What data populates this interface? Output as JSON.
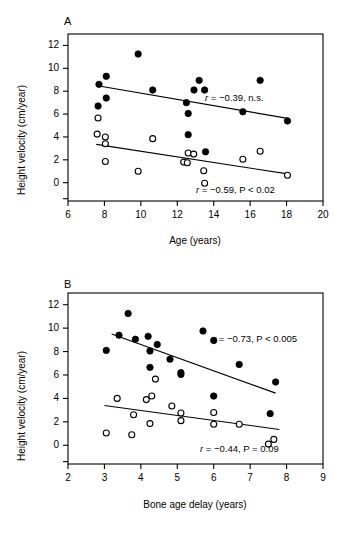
{
  "figure": {
    "panels": [
      {
        "letter": "A",
        "chart_data": {
          "type": "scatter",
          "title": "",
          "xlabel": "Age (years)",
          "ylabel": "Height velocity (cm/year)",
          "xlim": [
            6,
            20
          ],
          "ylim": [
            -1.6,
            13
          ],
          "xticks": [
            6,
            8,
            10,
            12,
            14,
            16,
            18,
            20
          ],
          "xtick_labels": [
            "6",
            "8",
            "10",
            "12",
            "14",
            "16",
            "18",
            "20"
          ],
          "yticks": [
            0,
            2,
            4,
            6,
            8,
            10,
            12
          ],
          "ytick_labels": [
            "0",
            "2",
            "4",
            "6",
            "8",
            "10",
            "12"
          ],
          "grid": false,
          "legend": "none",
          "series": [
            {
              "name": "filled-circles",
              "marker": "filled-circle",
              "points": [
                [
                  7.7,
                  8.6
                ],
                [
                  7.65,
                  6.7
                ],
                [
                  8.1,
                  9.3
                ],
                [
                  8.1,
                  7.4
                ],
                [
                  9.85,
                  11.25
                ],
                [
                  10.65,
                  8.1
                ],
                [
                  12.5,
                  7.0
                ],
                [
                  12.6,
                  6.05
                ],
                [
                  12.6,
                  4.2
                ],
                [
                  13.2,
                  8.95
                ],
                [
                  13.5,
                  8.1
                ],
                [
                  13.55,
                  2.7
                ],
                [
                  15.6,
                  6.2
                ],
                [
                  16.55,
                  8.95
                ],
                [
                  18.05,
                  5.4
                ]
              ],
              "trendline": {
                "x1": 7.55,
                "y1": 8.5,
                "x2": 18.15,
                "y2": 5.6
              },
              "annotation": "r = −0.39, n.s.",
              "annotation_r": "−0.39",
              "annotation_p": "n.s."
            },
            {
              "name": "open-circles",
              "marker": "open-circle",
              "points": [
                [
                  7.65,
                  5.65
                ],
                [
                  7.6,
                  4.25
                ],
                [
                  8.05,
                  4.0
                ],
                [
                  8.05,
                  3.4
                ],
                [
                  8.05,
                  1.85
                ],
                [
                  9.85,
                  1.0
                ],
                [
                  10.65,
                  3.85
                ],
                [
                  12.35,
                  1.8
                ],
                [
                  12.55,
                  1.75
                ],
                [
                  12.6,
                  2.6
                ],
                [
                  12.9,
                  2.5
                ],
                [
                  13.45,
                  1.05
                ],
                [
                  13.5,
                  -0.05
                ],
                [
                  15.6,
                  2.05
                ],
                [
                  16.55,
                  2.75
                ],
                [
                  18.05,
                  0.65
                ]
              ],
              "trendline": {
                "x1": 7.55,
                "y1": 3.35,
                "x2": 18.15,
                "y2": 0.75
              },
              "annotation": "r = −0.59, P < 0.02",
              "annotation_r": "−0.59",
              "annotation_p": "P < 0.02"
            }
          ]
        }
      },
      {
        "letter": "B",
        "chart_data": {
          "type": "scatter",
          "title": "",
          "xlabel": "Bone age delay (years)",
          "ylabel": "Height velocity (cm/year)",
          "xlim": [
            2,
            9
          ],
          "ylim": [
            -1.6,
            13
          ],
          "xticks": [
            2,
            3,
            4,
            5,
            6,
            7,
            8,
            9
          ],
          "xtick_labels": [
            "2",
            "3",
            "4",
            "5",
            "6",
            "7",
            "8",
            "9"
          ],
          "yticks": [
            0,
            2,
            4,
            6,
            8,
            10,
            12
          ],
          "ytick_labels": [
            "0",
            "2",
            "4",
            "6",
            "8",
            "10",
            "12"
          ],
          "grid": false,
          "legend": "none",
          "series": [
            {
              "name": "filled-circles",
              "marker": "filled-circle",
              "points": [
                [
                  3.05,
                  8.1
                ],
                [
                  3.4,
                  9.4
                ],
                [
                  3.65,
                  11.25
                ],
                [
                  3.85,
                  9.05
                ],
                [
                  4.2,
                  9.3
                ],
                [
                  4.25,
                  8.05
                ],
                [
                  4.25,
                  6.65
                ],
                [
                  4.45,
                  8.6
                ],
                [
                  4.8,
                  7.35
                ],
                [
                  5.1,
                  6.2
                ],
                [
                  5.1,
                  6.05
                ],
                [
                  6.0,
                  8.95
                ],
                [
                  6.0,
                  4.2
                ],
                [
                  6.7,
                  6.9
                ],
                [
                  7.55,
                  2.7
                ],
                [
                  7.7,
                  5.4
                ]
              ],
              "trendline": {
                "x1": 3.2,
                "y1": 9.5,
                "x2": 7.7,
                "y2": 4.45
              },
              "annotation": "r = −0.73, P < 0.005",
              "annotation_r": "−0.73",
              "annotation_p": "P < 0.005"
            },
            {
              "name": "open-circles",
              "marker": "open-circle",
              "points": [
                [
                  3.05,
                  1.05
                ],
                [
                  3.35,
                  4.0
                ],
                [
                  3.8,
                  2.6
                ],
                [
                  3.75,
                  0.9
                ],
                [
                  4.15,
                  3.9
                ],
                [
                  4.25,
                  1.85
                ],
                [
                  4.3,
                  4.2
                ],
                [
                  4.4,
                  5.65
                ],
                [
                  4.85,
                  3.35
                ],
                [
                  5.1,
                  2.75
                ],
                [
                  5.1,
                  2.1
                ],
                [
                  6.0,
                  2.8
                ],
                [
                  6.0,
                  1.8
                ],
                [
                  6.7,
                  1.8
                ],
                [
                  7.5,
                  0.1
                ],
                [
                  7.65,
                  0.5
                ]
              ],
              "trendline": {
                "x1": 3.0,
                "y1": 3.4,
                "x2": 7.8,
                "y2": 1.35
              },
              "annotation": "r = −0.44, P = 0.09",
              "annotation_r": "−0.44",
              "annotation_p": "P = 0.09"
            }
          ]
        }
      }
    ]
  }
}
